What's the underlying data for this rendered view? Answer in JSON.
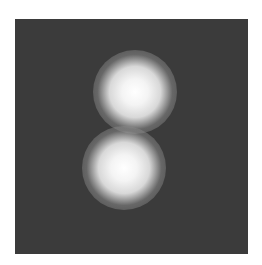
{
  "image": {
    "description": "Grayscale image with two bright blurred spots on a dark square background",
    "background_color": "#3b3b3b",
    "spots": [
      {
        "name": "upper-spot",
        "cx": 120,
        "cy": 73,
        "core_radius": 18,
        "glow_radius": 42
      },
      {
        "name": "lower-spot",
        "cx": 109,
        "cy": 149,
        "core_radius": 18,
        "glow_radius": 42
      }
    ]
  }
}
